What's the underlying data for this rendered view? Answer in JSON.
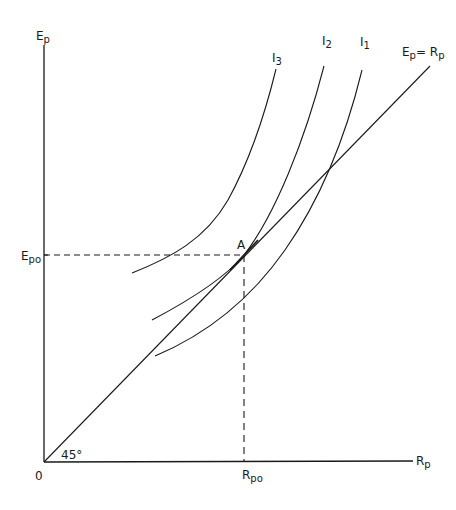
{
  "diagram": {
    "axes": {
      "y_label": "E",
      "y_label_sub": "p",
      "x_label": "R",
      "x_label_sub": "p",
      "origin_label": "0",
      "angle_label": "45°"
    },
    "line_45": {
      "label_left": "E",
      "label_left_sub": "p",
      "label_eq": "= R",
      "label_right_sub": "p"
    },
    "point": {
      "label": "A",
      "y_tick_label": "E",
      "y_tick_sub": "po",
      "x_tick_label": "R",
      "x_tick_sub": "po"
    },
    "curves": [
      {
        "name": "I",
        "sub": "3"
      },
      {
        "name": "I",
        "sub": "2"
      },
      {
        "name": "I",
        "sub": "1"
      }
    ],
    "colors": {
      "line": "#1a1a1a",
      "background": "#ffffff"
    }
  }
}
